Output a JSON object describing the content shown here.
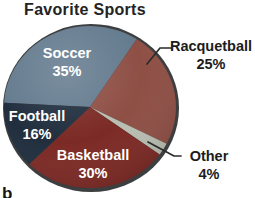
{
  "chart_data": {
    "type": "pie",
    "title": "Favorite Sports",
    "legend": "none",
    "labels_style": "inside slices for large wedges, outside with leader lines for Racquetball and Other",
    "slices": [
      {
        "label": "Soccer",
        "pct": "35%",
        "value": 35,
        "color": "#647b8e",
        "text_color": "#ffffff",
        "label_placement": "inside",
        "start_deg": 177,
        "end_deg": 57
      },
      {
        "label": "Racquetball",
        "pct": "25%",
        "value": 25,
        "color": "#8e4f45",
        "text_color": "#1c1c1c",
        "label_placement": "outside",
        "start_deg": 57,
        "end_deg": -27
      },
      {
        "label": "Other",
        "pct": "4%",
        "value": 4,
        "color": "#b9beb1",
        "text_color": "#1c1c1c",
        "label_placement": "outside",
        "start_deg": -27,
        "end_deg": -36
      },
      {
        "label": "Basketball",
        "pct": "30%",
        "value": 30,
        "color": "#7c2a25",
        "text_color": "#ffffff",
        "label_placement": "inside",
        "start_deg": -36,
        "end_deg": -135
      },
      {
        "label": "Football",
        "pct": "16%",
        "value": 16,
        "color": "#202e3e",
        "text_color": "#ffffff",
        "label_placement": "inside",
        "start_deg": -135,
        "end_deg": -183
      }
    ],
    "rim_color": "#3d3e40",
    "leader_line_color": "#2b2b2b"
  },
  "corner_glyph": "b"
}
